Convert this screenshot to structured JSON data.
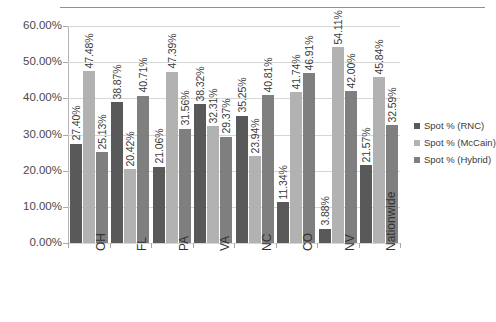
{
  "chart_data": {
    "type": "bar",
    "title": "",
    "subtitle": "",
    "xlabel": "",
    "ylabel": "",
    "ylim": [
      0,
      60
    ],
    "yticks": [
      "0.00%",
      "10.00%",
      "20.00%",
      "30.00%",
      "40.00%",
      "50.00%",
      "60.00%"
    ],
    "ytick_values": [
      0,
      10,
      20,
      30,
      40,
      50,
      60
    ],
    "grid": true,
    "legend_position": "right",
    "categories": [
      "OH",
      "FL",
      "PA",
      "VA",
      "NC",
      "CO",
      "NV",
      "Nationwide"
    ],
    "series": [
      {
        "name": "Spot % (RNC)",
        "color": "#595959",
        "values": [
          27.4,
          38.87,
          21.06,
          38.32,
          35.25,
          11.34,
          3.88,
          21.57
        ],
        "labels": [
          "27.40%",
          "38.87%",
          "21.06%",
          "38.32%",
          "35.25%",
          "11.34%",
          "3.88%",
          "21.57%"
        ]
      },
      {
        "name": "Spot % (McCain)",
        "color": "#b2b2b2",
        "values": [
          47.48,
          20.42,
          47.39,
          32.31,
          23.94,
          41.74,
          54.11,
          45.84
        ],
        "labels": [
          "47.48%",
          "20.42%",
          "47.39%",
          "32.31%",
          "23.94%",
          "41.74%",
          "54.11%",
          "45.84%"
        ]
      },
      {
        "name": "Spot % (Hybrid)",
        "color": "#7f7f7f",
        "values": [
          25.13,
          40.71,
          31.56,
          29.37,
          40.81,
          46.91,
          42.0,
          32.59
        ],
        "labels": [
          "25.13%",
          "40.71%",
          "31.56%",
          "29.37%",
          "40.81%",
          "46.91%",
          "42.00%",
          "32.59%"
        ]
      }
    ]
  }
}
